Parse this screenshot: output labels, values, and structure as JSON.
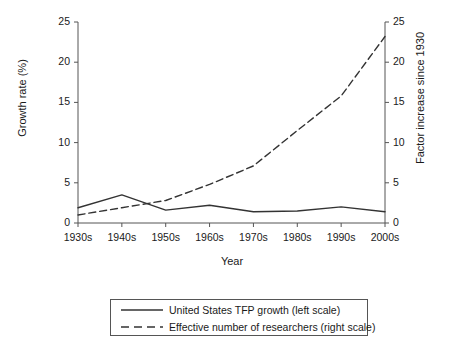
{
  "chart_data": {
    "type": "line",
    "title": "",
    "xlabel": "Year",
    "ylabel": "Growth rate (%)",
    "ylabel_right": "Factor increase since 1930",
    "categories": [
      "1930s",
      "1940s",
      "1950s",
      "1960s",
      "1970s",
      "1980s",
      "1990s",
      "2000s"
    ],
    "ylim": [
      0,
      25
    ],
    "yticks": [
      0,
      5,
      10,
      15,
      20,
      25
    ],
    "ylim_right": [
      0,
      25
    ],
    "yticks_right": [
      0,
      5,
      10,
      15,
      20,
      25
    ],
    "grid": false,
    "legend_position": "below-axes",
    "series": [
      {
        "name": "United States TFP growth (left scale)",
        "axis": "left",
        "style": "solid",
        "color": "#333333",
        "values": [
          1.9,
          3.5,
          1.6,
          2.2,
          1.4,
          1.5,
          2.0,
          1.4
        ]
      },
      {
        "name": "Effective number of researchers (right scale)",
        "axis": "right",
        "style": "dashed",
        "color": "#333333",
        "values": [
          1.0,
          1.9,
          2.8,
          4.8,
          7.1,
          11.5,
          15.8,
          23.2
        ]
      }
    ]
  },
  "axes": {
    "xlabel": "Year",
    "ylabel_left": "Growth rate (%)",
    "ylabel_right": "Factor increase since 1930",
    "xtick_labels": [
      "1930s",
      "1940s",
      "1950s",
      "1960s",
      "1970s",
      "1980s",
      "1990s",
      "2000s"
    ],
    "ytick_labels_left": [
      "0",
      "5",
      "10",
      "15",
      "20",
      "25"
    ],
    "ytick_labels_right": [
      "0",
      "5",
      "10",
      "15",
      "20",
      "25"
    ]
  },
  "legend": {
    "entries": [
      {
        "label": "United States TFP growth (left scale)",
        "style": "solid"
      },
      {
        "label": "Effective number of researchers (right scale)",
        "style": "dashed"
      }
    ]
  },
  "colors": {
    "line": "#333333",
    "axis": "#555555",
    "text": "#1a1a1a",
    "background": "#ffffff"
  }
}
